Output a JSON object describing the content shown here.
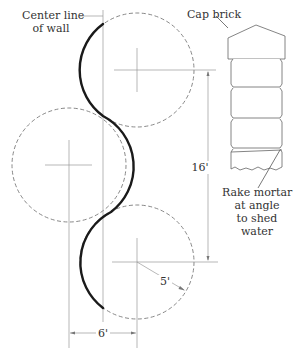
{
  "diagram": {
    "colors": {
      "wall_line": "#1a1a1a",
      "construction_line": "#8a8a8a",
      "dashed_circle": "#7a7a7a",
      "text": "#333333",
      "background": "#ffffff"
    },
    "labels": {
      "center_line_line1": "Center line",
      "center_line_line2": "of wall",
      "cap_brick": "Cap brick",
      "rake_line1": "Rake mortar",
      "rake_line2": "at angle",
      "rake_line3": "to shed",
      "rake_line4": "water"
    },
    "dimensions": {
      "vertical_spacing": "16'",
      "radius": "5'",
      "offset": "6'"
    },
    "circles": [
      {
        "name": "top",
        "cx": 137,
        "cy": 70,
        "r": 57
      },
      {
        "name": "middle",
        "cx": 69,
        "cy": 165,
        "r": 57
      },
      {
        "name": "bottom",
        "cx": 137,
        "cy": 262,
        "r": 57
      }
    ]
  }
}
